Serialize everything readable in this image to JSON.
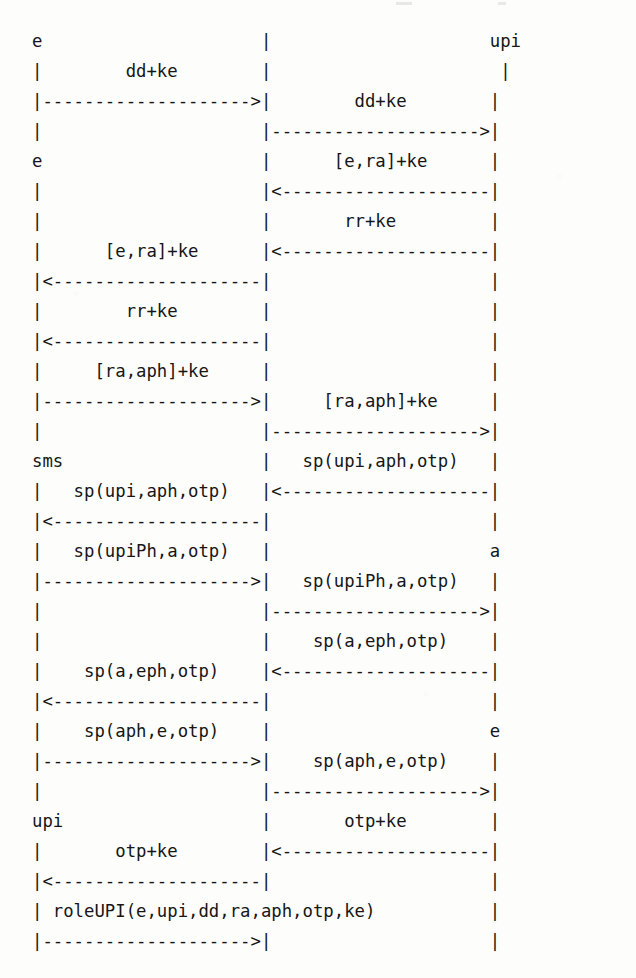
{
  "document": {
    "kind": "ascii-sequence-diagram",
    "title": "UPI registration protocol message sequence chart",
    "background_color": "#fdfdfc",
    "text_color": "#161616"
  },
  "lifelines": [
    {
      "id": "left",
      "column": 0,
      "labels": [
        "e",
        "e",
        "sms",
        "upi"
      ]
    },
    {
      "id": "middle",
      "column": 22,
      "labels": []
    },
    {
      "id": "right",
      "column": 43,
      "labels": [
        "upi",
        "a",
        "e"
      ]
    }
  ],
  "messages": [
    {
      "index": 1,
      "from": "left",
      "to": "middle",
      "direction": "right",
      "label": "dd+ke"
    },
    {
      "index": 2,
      "from": "middle",
      "to": "right",
      "direction": "right",
      "label": "dd+ke"
    },
    {
      "index": 3,
      "from": "right",
      "to": "middle",
      "direction": "left",
      "label": "[e,ra]+ke"
    },
    {
      "index": 4,
      "from": "right",
      "to": "middle",
      "direction": "left",
      "label": "rr+ke"
    },
    {
      "index": 5,
      "from": "middle",
      "to": "left",
      "direction": "left",
      "label": "[e,ra]+ke"
    },
    {
      "index": 6,
      "from": "middle",
      "to": "left",
      "direction": "left",
      "label": "rr+ke"
    },
    {
      "index": 7,
      "from": "left",
      "to": "middle",
      "direction": "right",
      "label": "[ra,aph]+ke"
    },
    {
      "index": 8,
      "from": "middle",
      "to": "right",
      "direction": "right",
      "label": "[ra,aph]+ke"
    },
    {
      "index": 9,
      "from": "right",
      "to": "middle",
      "direction": "left",
      "label": "sp(upi,aph,otp)"
    },
    {
      "index": 10,
      "from": "middle",
      "to": "left",
      "direction": "left",
      "label": "sp(upi,aph,otp)"
    },
    {
      "index": 11,
      "from": "left",
      "to": "middle",
      "direction": "right",
      "label": "sp(upiPh,a,otp)"
    },
    {
      "index": 12,
      "from": "middle",
      "to": "right",
      "direction": "right",
      "label": "sp(upiPh,a,otp)"
    },
    {
      "index": 13,
      "from": "right",
      "to": "middle",
      "direction": "left",
      "label": "sp(a,eph,otp)"
    },
    {
      "index": 14,
      "from": "middle",
      "to": "left",
      "direction": "left",
      "label": "sp(a,eph,otp)"
    },
    {
      "index": 15,
      "from": "left",
      "to": "middle",
      "direction": "right",
      "label": "sp(aph,e,otp)"
    },
    {
      "index": 16,
      "from": "middle",
      "to": "right",
      "direction": "right",
      "label": "sp(aph,e,otp)"
    },
    {
      "index": 17,
      "from": "right",
      "to": "middle",
      "direction": "left",
      "label": "otp+ke"
    },
    {
      "index": 18,
      "from": "middle",
      "to": "left",
      "direction": "left",
      "label": "otp+ke"
    },
    {
      "index": 19,
      "from": "left",
      "to": "middle",
      "direction": "right",
      "label": "roleUPI(e,upi,dd,ra,aph,otp,ke)"
    }
  ],
  "ascii": {
    "art": "e                     |                     upi\n|        dd+ke        |                      |\n|-------------------->|        dd+ke        |\n|                     |-------------------->|\ne                     |      [e,ra]+ke      |\n|                     |<--------------------|\n|                     |       rr+ke         |\n|      [e,ra]+ke      |<--------------------|\n|<--------------------|                     |\n|        rr+ke        |                     |\n|<--------------------|                     |\n|     [ra,aph]+ke     |                     |\n|-------------------->|     [ra,aph]+ke     |\n|                     |-------------------->|\nsms                   |   sp(upi,aph,otp)   |\n|   sp(upi,aph,otp)   |<--------------------|\n|<--------------------|                     |\n|   sp(upiPh,a,otp)   |                     a\n|-------------------->|   sp(upiPh,a,otp)   |\n|                     |-------------------->|\n|                     |    sp(a,eph,otp)    |\n|    sp(a,eph,otp)    |<--------------------|\n|<--------------------|                     |\n|    sp(aph,e,otp)    |                     e\n|-------------------->|    sp(aph,e,otp)    |\n|                     |-------------------->|\nupi                   |       otp+ke        |\n|       otp+ke        |<--------------------|\n|<--------------------|                     |\n| roleUPI(e,upi,dd,ra,aph,otp,ke)           |\n|-------------------->|                     |"
  },
  "rows": [
    {
      "n": 1,
      "left": "e",
      "mid": "|",
      "right": "upi",
      "type": "actor-labels"
    },
    {
      "n": 2,
      "left": "|",
      "label": "dd+ke",
      "mid": "|",
      "right": "|",
      "type": "label-left"
    },
    {
      "n": 3,
      "left": "arrow-right",
      "mid": "|",
      "right": "|",
      "label": "dd+ke",
      "type": "arrow-left-span"
    },
    {
      "n": 4,
      "left": "|",
      "mid": "arrow-right",
      "right": "|",
      "type": "arrow-right-span"
    },
    {
      "n": 5,
      "left": "e",
      "mid": "|",
      "right": "|",
      "label": "[e,ra]+ke",
      "type": "label-right"
    },
    {
      "n": 6,
      "left": "|",
      "mid": "arrow-left",
      "right": "|",
      "type": "arrow-right-span"
    },
    {
      "n": 7,
      "left": "|",
      "mid": "|",
      "right": "|",
      "label": "rr+ke",
      "type": "label-right"
    },
    {
      "n": 8,
      "left": "|",
      "label": "[e,ra]+ke",
      "mid": "arrow-left",
      "right": "|",
      "type": "mixed"
    },
    {
      "n": 9,
      "left": "arrow-left",
      "mid": "|",
      "right": "|",
      "type": "arrow-left-span"
    },
    {
      "n": 10,
      "left": "|",
      "label": "rr+ke",
      "mid": "|",
      "right": "|",
      "type": "label-left"
    },
    {
      "n": 11,
      "left": "arrow-left",
      "mid": "|",
      "right": "|",
      "type": "arrow-left-span"
    },
    {
      "n": 12,
      "left": "|",
      "label": "[ra,aph]+ke",
      "mid": "|",
      "right": "|",
      "type": "label-left"
    },
    {
      "n": 13,
      "left": "arrow-right",
      "mid": "|",
      "right": "|",
      "label": "[ra,aph]+ke",
      "type": "mixed"
    },
    {
      "n": 14,
      "left": "|",
      "mid": "arrow-right",
      "right": "|",
      "type": "arrow-right-span"
    },
    {
      "n": 15,
      "left": "sms",
      "mid": "|",
      "right": "|",
      "label": "sp(upi,aph,otp)",
      "type": "label-right"
    },
    {
      "n": 16,
      "left": "|",
      "label": "sp(upi,aph,otp)",
      "mid": "arrow-left",
      "right": "|",
      "type": "mixed"
    },
    {
      "n": 17,
      "left": "arrow-left",
      "mid": "|",
      "right": "|",
      "type": "arrow-left-span"
    },
    {
      "n": 18,
      "left": "|",
      "label": "sp(upiPh,a,otp)",
      "mid": "|",
      "right": "a",
      "type": "label-left"
    },
    {
      "n": 19,
      "left": "arrow-right",
      "mid": "|",
      "right": "|",
      "label": "sp(upiPh,a,otp)",
      "type": "mixed"
    },
    {
      "n": 20,
      "left": "|",
      "mid": "arrow-right",
      "right": "|",
      "type": "arrow-right-span"
    },
    {
      "n": 21,
      "left": "|",
      "mid": "|",
      "right": "|",
      "label": "sp(a,eph,otp)",
      "type": "label-right"
    },
    {
      "n": 22,
      "left": "|",
      "label": "sp(a,eph,otp)",
      "mid": "arrow-left",
      "right": "|",
      "type": "mixed"
    },
    {
      "n": 23,
      "left": "arrow-left",
      "mid": "|",
      "right": "|",
      "type": "arrow-left-span"
    },
    {
      "n": 24,
      "left": "|",
      "label": "sp(aph,e,otp)",
      "mid": "|",
      "right": "e",
      "type": "label-left"
    },
    {
      "n": 25,
      "left": "arrow-right",
      "mid": "|",
      "right": "|",
      "label": "sp(aph,e,otp)",
      "type": "mixed"
    },
    {
      "n": 26,
      "left": "|",
      "mid": "arrow-right",
      "right": "|",
      "type": "arrow-right-span"
    },
    {
      "n": 27,
      "left": "upi",
      "mid": "|",
      "right": "|",
      "label": "otp+ke",
      "type": "label-right"
    },
    {
      "n": 28,
      "left": "|",
      "label": "otp+ke",
      "mid": "arrow-left",
      "right": "|",
      "type": "mixed"
    },
    {
      "n": 29,
      "left": "arrow-left",
      "mid": "|",
      "right": "|",
      "type": "arrow-left-span"
    },
    {
      "n": 30,
      "left": "|",
      "label": "roleUPI(e,upi,dd,ra,aph,otp,ke)",
      "mid": "",
      "right": "|",
      "type": "label-wide"
    },
    {
      "n": 31,
      "left": "arrow-right",
      "mid": "|",
      "right": "|",
      "type": "arrow-left-span"
    }
  ]
}
